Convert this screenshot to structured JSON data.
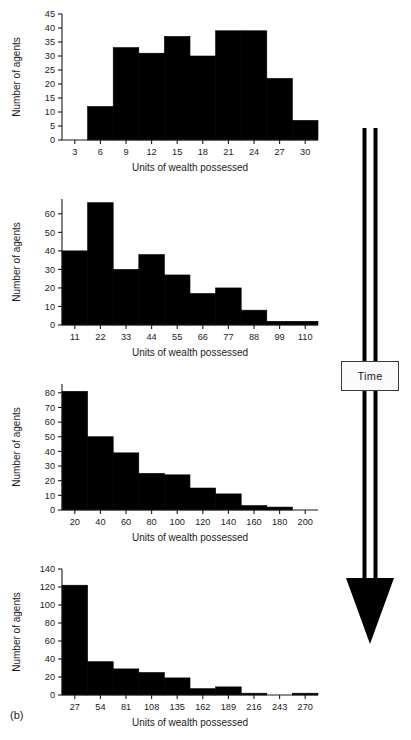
{
  "figure": {
    "caption_label": "(b)",
    "annotation": {
      "label": "Time",
      "direction": "downward-arrow",
      "color": "#000000"
    },
    "bar_color": "#000000",
    "axis_color": "#1a1a1a",
    "background": "#ffffff"
  },
  "chart_data": [
    {
      "type": "bar",
      "title": "",
      "subtitle": "",
      "xlabel": "Units of wealth possessed",
      "ylabel": "Number of agents",
      "xticks": [
        3,
        6,
        9,
        12,
        15,
        18,
        21,
        24,
        27,
        30
      ],
      "yticks": [
        0,
        5,
        10,
        15,
        20,
        25,
        30,
        35,
        40,
        45
      ],
      "xlim": [
        1.5,
        31.5
      ],
      "ylim": [
        0,
        45
      ],
      "grid": false,
      "legend": "none",
      "bin_width": 3,
      "bin_starts": [
        4.5,
        7.5,
        10.5,
        13.5,
        16.5,
        19.5,
        22.5,
        25.5,
        28.5
      ],
      "categories": [
        "4.5-7.5",
        "7.5-10.5",
        "10.5-13.5",
        "13.5-16.5",
        "16.5-19.5",
        "19.5-22.5",
        "22.5-25.5",
        "25.5-28.5",
        "28.5-31.5"
      ],
      "values": [
        12,
        33,
        31,
        37,
        30,
        39,
        39,
        22,
        7
      ]
    },
    {
      "type": "bar",
      "title": "",
      "subtitle": "",
      "xlabel": "Units of wealth possessed",
      "ylabel": "Number of agents",
      "xticks": [
        11,
        22,
        33,
        44,
        55,
        66,
        77,
        88,
        99,
        110
      ],
      "yticks": [
        0,
        10,
        20,
        30,
        40,
        50,
        60
      ],
      "xlim": [
        5.5,
        115.5
      ],
      "ylim": [
        0,
        68
      ],
      "grid": false,
      "legend": "none",
      "bin_width": 11,
      "bin_starts": [
        5.5,
        16.5,
        27.5,
        38.5,
        49.5,
        60.5,
        71.5,
        82.5,
        93.5,
        104.5
      ],
      "categories": [
        "5.5-16.5",
        "16.5-27.5",
        "27.5-38.5",
        "38.5-49.5",
        "49.5-60.5",
        "60.5-71.5",
        "71.5-82.5",
        "82.5-93.5",
        "93.5-104.5",
        "104.5-115.5"
      ],
      "values": [
        40,
        66,
        30,
        38,
        27,
        17,
        20,
        8,
        2,
        2
      ]
    },
    {
      "type": "bar",
      "title": "",
      "subtitle": "",
      "xlabel": "Units of wealth possessed",
      "ylabel": "Number of agents",
      "xticks": [
        20,
        40,
        60,
        80,
        100,
        120,
        140,
        160,
        180,
        200
      ],
      "yticks": [
        0,
        10,
        20,
        30,
        40,
        50,
        60,
        70,
        80
      ],
      "xlim": [
        10,
        210
      ],
      "ylim": [
        0,
        86
      ],
      "grid": false,
      "legend": "none",
      "bin_width": 20,
      "bin_starts": [
        10,
        30,
        50,
        70,
        90,
        110,
        130,
        150,
        170,
        190
      ],
      "categories": [
        "10-30",
        "30-50",
        "50-70",
        "70-90",
        "90-110",
        "110-130",
        "130-150",
        "150-170",
        "170-190",
        "190-210"
      ],
      "values": [
        81,
        50,
        39,
        25,
        24,
        15,
        11,
        3,
        2,
        0
      ]
    },
    {
      "type": "bar",
      "title": "",
      "subtitle": "",
      "xlabel": "Units of wealth possessed",
      "ylabel": "Number of agents",
      "xticks": [
        27,
        54,
        81,
        108,
        135,
        162,
        189,
        216,
        243,
        270
      ],
      "yticks": [
        0,
        20,
        40,
        60,
        80,
        100,
        120,
        140
      ],
      "xlim": [
        13.5,
        283.5
      ],
      "ylim": [
        0,
        140
      ],
      "grid": false,
      "legend": "none",
      "bin_width": 27,
      "bin_starts": [
        13.5,
        40.5,
        67.5,
        94.5,
        121.5,
        148.5,
        175.5,
        202.5,
        229.5,
        256.5
      ],
      "categories": [
        "13.5-40.5",
        "40.5-67.5",
        "67.5-94.5",
        "94.5-121.5",
        "121.5-148.5",
        "148.5-175.5",
        "175.5-202.5",
        "202.5-229.5",
        "229.5-256.5",
        "256.5-283.5"
      ],
      "values": [
        122,
        37,
        29,
        25,
        19,
        7,
        9,
        2,
        0,
        2
      ]
    }
  ]
}
